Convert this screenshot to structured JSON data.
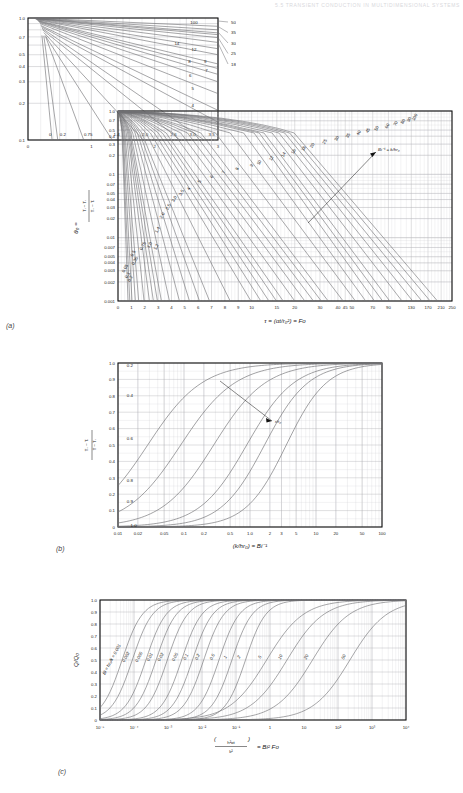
{
  "header": {
    "running_title": "5.5  TRANSIENT CONDUCTION IN MULTIDIMENSIONAL SYSTEMS"
  },
  "panels": {
    "a_label": "(a)",
    "b_label": "(b)",
    "c_label": "(c)"
  },
  "chart_data": [
    {
      "id": "inset-a",
      "type": "line",
      "title": "",
      "xlabel": "",
      "ylabel": "",
      "xlim": [
        0,
        3
      ],
      "ylim": [
        0.1,
        1.0
      ],
      "yscale": "log",
      "xscale": "linear",
      "grid": true,
      "xticks": [
        "0",
        "1",
        "2",
        "3"
      ],
      "yticks": [
        "1.0",
        "0.7",
        "0.5",
        "0.4",
        "0.3",
        "0.2",
        "0.1"
      ],
      "inside_labels": [
        "100",
        "14",
        "12",
        "8",
        "9",
        "6",
        "7",
        "5",
        "4",
        "3.5",
        "3.0",
        "2.6",
        "2.0",
        "1.4",
        "0.75",
        "0.2",
        "0"
      ],
      "outside_labels": [
        "50",
        "35",
        "30",
        "25",
        "18"
      ],
      "series_note": "Bi^-1 = k/hr0 parameter family, expanded scale of panel (a)"
    },
    {
      "id": "panel-a",
      "type": "line",
      "title": "",
      "xlabel": "τ = (αt/r₀²) = Fo",
      "ylabel": "θ₀ = (T₀ − Tᵢ) / (Tᵢ − Tᵢ)",
      "ylabel_parts": {
        "sym": "θ₀",
        "eq": "=",
        "num": "T₀ − Tᵢ",
        "den": "Tᵢ − Tᵢ"
      },
      "xlim": [
        0,
        250
      ],
      "ylim": [
        0.001,
        1.0
      ],
      "yscale": "log",
      "xscale": "piecewise-compressed",
      "grid": true,
      "annotation": "Bi⁻¹ = k/hr₀",
      "xticks": [
        "0",
        "1",
        "2",
        "3",
        "4",
        "5",
        "6",
        "7",
        "8",
        "9",
        "10",
        "15",
        "20",
        "30",
        "40",
        "45",
        "50",
        "70",
        "90",
        "130",
        "170",
        "210",
        "250"
      ],
      "yticks": [
        "1.0",
        "0.7",
        "0.5",
        "0.4",
        "0.3",
        "0.2",
        "0.1",
        "0.07",
        "0.05",
        "0.04",
        "0.03",
        "0.02",
        "0.01",
        "0.007",
        "0.005",
        "0.004",
        "0.003",
        "0.002",
        "0.001"
      ],
      "curve_labels": [
        "0.05",
        "0.1",
        "0.2",
        "0.35",
        "0.5",
        "0.75",
        "1.0",
        "1.2",
        "1.4",
        "1.6",
        "2.0",
        "2.5",
        "3.0",
        "3.5",
        "4",
        "5",
        "6",
        "7",
        "8",
        "9",
        "10",
        "12",
        "14",
        "16",
        "18",
        "20",
        "25",
        "30",
        "35",
        "40",
        "45",
        "50",
        "60",
        "70",
        "80",
        "90",
        "100"
      ],
      "series_note": "Midpoint temperature θ₀ for a sphere of radius r₀ (Heisler chart)"
    },
    {
      "id": "panel-b",
      "type": "line",
      "title": "",
      "xlabel": "(k/hr₀) = Bi⁻¹",
      "ylabel": "(T − Tᵢ) / (T₀ − Tᵢ)",
      "ylabel_parts": {
        "num": "T − Tᵢ",
        "den": "T₀ − Tᵢ"
      },
      "xlim": [
        0.01,
        100
      ],
      "ylim": [
        0,
        1.0
      ],
      "xscale": "log",
      "yscale": "linear",
      "grid": true,
      "annotation": "r/r₀",
      "xticks": [
        "0.01",
        "0.02",
        "0.05",
        "0.1",
        "0.2",
        "0.5",
        "1.0",
        "2",
        "3",
        "5",
        "10",
        "20",
        "50",
        "100"
      ],
      "yticks": [
        "0",
        "0.1",
        "0.2",
        "0.3",
        "0.4",
        "0.5",
        "0.6",
        "0.7",
        "0.8",
        "0.9",
        "1.0"
      ],
      "curve_labels": [
        "0.2",
        "0.4",
        "0.6",
        "0.8",
        "0.9",
        "1.0"
      ],
      "series_note": "Temperature distribution in a sphere, parameter r/r₀"
    },
    {
      "id": "panel-c",
      "type": "line",
      "title": "",
      "xlabel": "(h²αt / k²) = Bi² Fo",
      "xlabel_parts": {
        "num": "h²αt",
        "den": "k²",
        "eq": "= Bi² Fo"
      },
      "ylabel": "Q/Q₀",
      "xlim": [
        1e-05,
        10000
      ],
      "ylim": [
        0,
        1.0
      ],
      "xscale": "log",
      "yscale": "linear",
      "grid": true,
      "first_label": "Bi = hr₀/k = 0.001",
      "xticks": [
        "10⁻⁵",
        "10⁻⁴",
        "10⁻³",
        "10⁻²",
        "10⁻¹",
        "1",
        "10",
        "10²",
        "10³",
        "10⁴"
      ],
      "yticks": [
        "0",
        "0.1",
        "0.2",
        "0.3",
        "0.4",
        "0.5",
        "0.6",
        "0.7",
        "0.8",
        "0.9",
        "1.0"
      ],
      "curve_labels": [
        "0.001",
        "0.002",
        "0.005",
        "0.01",
        "0.02",
        "0.05",
        "0.1",
        "0.2",
        "0.5",
        "1",
        "2",
        "5",
        "10",
        "20",
        "50"
      ],
      "series_note": "Dimensionless heat loss Q/Q₀ for a sphere of radius r₀"
    }
  ],
  "colors": {
    "curve": "#6f6f72",
    "grid_major": "#a9a9ae",
    "grid_minor": "#cfcfd4",
    "axis": "#111111",
    "text": "#1a1a1a"
  }
}
